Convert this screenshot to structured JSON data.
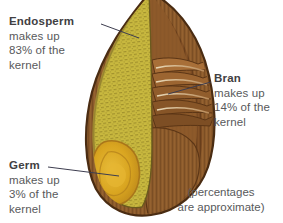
{
  "diagram": {
    "background_color": "#ffffff",
    "note": "(percentages\nare approximate)",
    "colors": {
      "endosperm_fill": "#c9b93f",
      "endosperm_hatch": "#6f5f1c",
      "bran_fill": "#8b5a2b",
      "bran_dark": "#63381a",
      "bran_light": "#c98f56",
      "germ_fill": "#d9a520",
      "germ_outline": "#a9761a",
      "outline": "#4a2c12",
      "leader_line": "#3d3d4f",
      "text": "#58595b",
      "term_text": "#414042"
    },
    "callouts": [
      {
        "id": "endosperm",
        "term": "Endosperm",
        "desc": "makes up\n83% of the\nkernel",
        "percent": 83
      },
      {
        "id": "bran",
        "term": "Bran",
        "desc": "makes up\n14% of the\nkernel",
        "percent": 14
      },
      {
        "id": "germ",
        "term": "Germ",
        "desc": "makes up\n3% of the\nkernel",
        "percent": 3
      }
    ]
  }
}
